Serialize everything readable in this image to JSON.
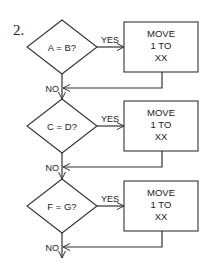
{
  "figure_number": "2.",
  "decisions": [
    {
      "condition": "A = B?",
      "yes_label": "YES",
      "no_label": "NO",
      "action": [
        "MOVE",
        "1 TO",
        "XX"
      ]
    },
    {
      "condition": "C = D?",
      "yes_label": "YES",
      "no_label": "NO",
      "action": [
        "MOVE",
        "1 TO",
        "XX"
      ]
    },
    {
      "condition": "F = G?",
      "yes_label": "YES",
      "no_label": "NO",
      "action": [
        "MOVE",
        "1 TO",
        "XX"
      ]
    }
  ],
  "colors": {
    "stroke": "#333333",
    "text": "#222222",
    "background": "#ffffff"
  }
}
